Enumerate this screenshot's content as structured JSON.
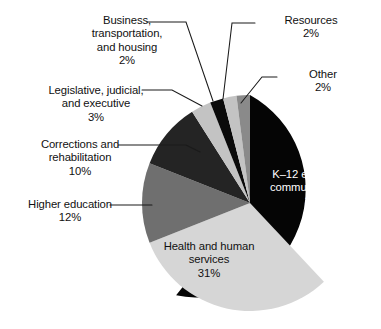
{
  "chart_data": {
    "type": "pie",
    "title": "",
    "subtitle": "",
    "xlabel": "",
    "ylabel": "",
    "legend_position": "none",
    "grid": false,
    "start_angle_deg": 0,
    "direction": "clockwise",
    "units": "percent",
    "total": 100,
    "categories": [
      "K–12 education & community college",
      "Health and human services",
      "Higher education",
      "Corrections and rehabilitation",
      "Legislative, judicial, and executive",
      "Business, transportation, and housing",
      "Resources",
      "Other"
    ],
    "values": [
      38,
      31,
      12,
      10,
      3,
      2,
      2,
      2
    ],
    "slices": [
      {
        "name": "K–12 education & community college",
        "label_text": "K–12 education &\ncommunity college",
        "value": 38,
        "value_label": "38%",
        "color": "#050505",
        "label_placement": "inside",
        "label_color": "#ffffff"
      },
      {
        "name": "Health and human services",
        "label_text": "Health and human\nservices",
        "value": 31,
        "value_label": "31%",
        "color": "#d6d6d6",
        "label_placement": "inside",
        "label_color": "#111111"
      },
      {
        "name": "Higher education",
        "label_text": "Higher education",
        "value": 12,
        "value_label": "12%",
        "color": "#6f6f6f",
        "label_placement": "outside",
        "label_color": "#111111"
      },
      {
        "name": "Corrections and rehabilitation",
        "label_text": "Corrections and\nrehabilitation",
        "value": 10,
        "value_label": "10%",
        "color": "#242424",
        "label_placement": "outside",
        "label_color": "#111111"
      },
      {
        "name": "Legislative, judicial, and executive",
        "label_text": "Legislative, judicial,\nand executive",
        "value": 3,
        "value_label": "3%",
        "color": "#c3c3c3",
        "label_placement": "outside",
        "label_color": "#111111"
      },
      {
        "name": "Business, transportation, and housing",
        "label_text": "Business,\ntransportation,\nand housing",
        "value": 2,
        "value_label": "2%",
        "color": "#0a0a0a",
        "label_placement": "outside",
        "label_color": "#111111"
      },
      {
        "name": "Resources",
        "label_text": "Resources",
        "value": 2,
        "value_label": "2%",
        "color": "#c3c3c3",
        "label_placement": "outside",
        "label_color": "#111111"
      },
      {
        "name": "Other",
        "label_text": "Other",
        "value": 2,
        "value_label": "2%",
        "color": "#8a8a8a",
        "label_placement": "outside",
        "label_color": "#111111"
      }
    ]
  },
  "labels": {
    "business": "Business,\ntransportation,\nand housing\n2%",
    "legislative": "Legislative, judicial,\nand executive\n3%",
    "corrections": "Corrections and\nrehabilitation\n10%",
    "higher_education": "Higher education\n12%",
    "resources": "Resources\n2%",
    "other": "Other\n2%",
    "k12": "K–12 education &\ncommunity college\n38%",
    "health": "Health and human\nservices\n31%"
  },
  "colors": {
    "background": "#ffffff",
    "text": "#111111",
    "text_on_dark": "#ffffff",
    "leader_line": "#1a1a1a",
    "slice_black": "#050505",
    "slice_near_black": "#242424",
    "slice_dark_gray": "#6f6f6f",
    "slice_mid_gray": "#8a8a8a",
    "slice_light_gray": "#c3c3c3",
    "slice_pale_gray": "#d6d6d6"
  }
}
